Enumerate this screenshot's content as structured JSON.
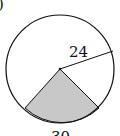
{
  "figure": {
    "part_marker": ")",
    "radius_label": "24",
    "arc_label": "30",
    "colors": {
      "stroke": "#111111",
      "shaded_sector": "#c8c8c8",
      "background": "#ffffff"
    }
  }
}
